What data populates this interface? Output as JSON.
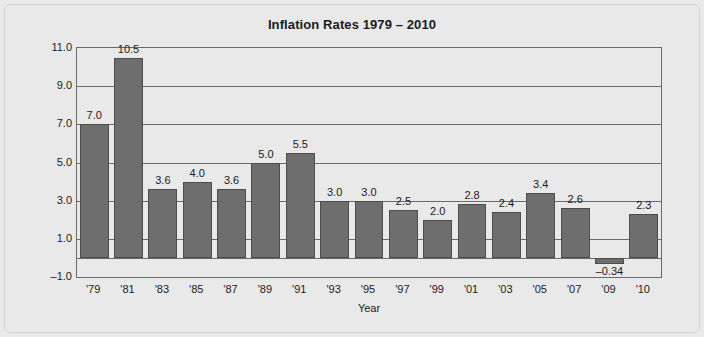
{
  "chart_data": {
    "type": "bar",
    "title": "Inflation Rates 1979 – 2010",
    "xlabel": "Year",
    "ylabel": "",
    "categories": [
      "'79",
      "'81",
      "'83",
      "'85",
      "'87",
      "'89",
      "'91",
      "'93",
      "'95",
      "'97",
      "'99",
      "'01",
      "'03",
      "'05",
      "'07",
      "'09",
      "'10"
    ],
    "values": [
      7.0,
      10.5,
      3.6,
      4.0,
      3.6,
      5.0,
      5.5,
      3.0,
      3.0,
      2.5,
      2.0,
      2.8,
      2.4,
      3.4,
      2.6,
      -0.34,
      2.3
    ],
    "value_labels": [
      "7.0",
      "10.5",
      "3.6",
      "4.0",
      "3.6",
      "5.0",
      "5.5",
      "3.0",
      "3.0",
      "2.5",
      "2.0",
      "2.8",
      "2.4",
      "3.4",
      "2.6",
      "–0.34",
      "2.3"
    ],
    "ylim": [
      -1.0,
      11.0
    ],
    "ytick_labels": [
      "11.0",
      "9.0",
      "7.0",
      "5.0",
      "3.0",
      "1.0",
      "–1.0"
    ],
    "ytick_values": [
      11.0,
      9.0,
      7.0,
      5.0,
      3.0,
      1.0,
      -1.0
    ],
    "grid": true,
    "legend": false,
    "colors": {
      "bar_fill": "#6e6e6e",
      "bar_stroke": "#4d4d4d",
      "plot_background": "#e9e9e9",
      "gridline": "#6a6a6a",
      "axis": "#6a6a6a",
      "text": "#1b1b1b",
      "figure_background": "#e9e9e9"
    }
  }
}
